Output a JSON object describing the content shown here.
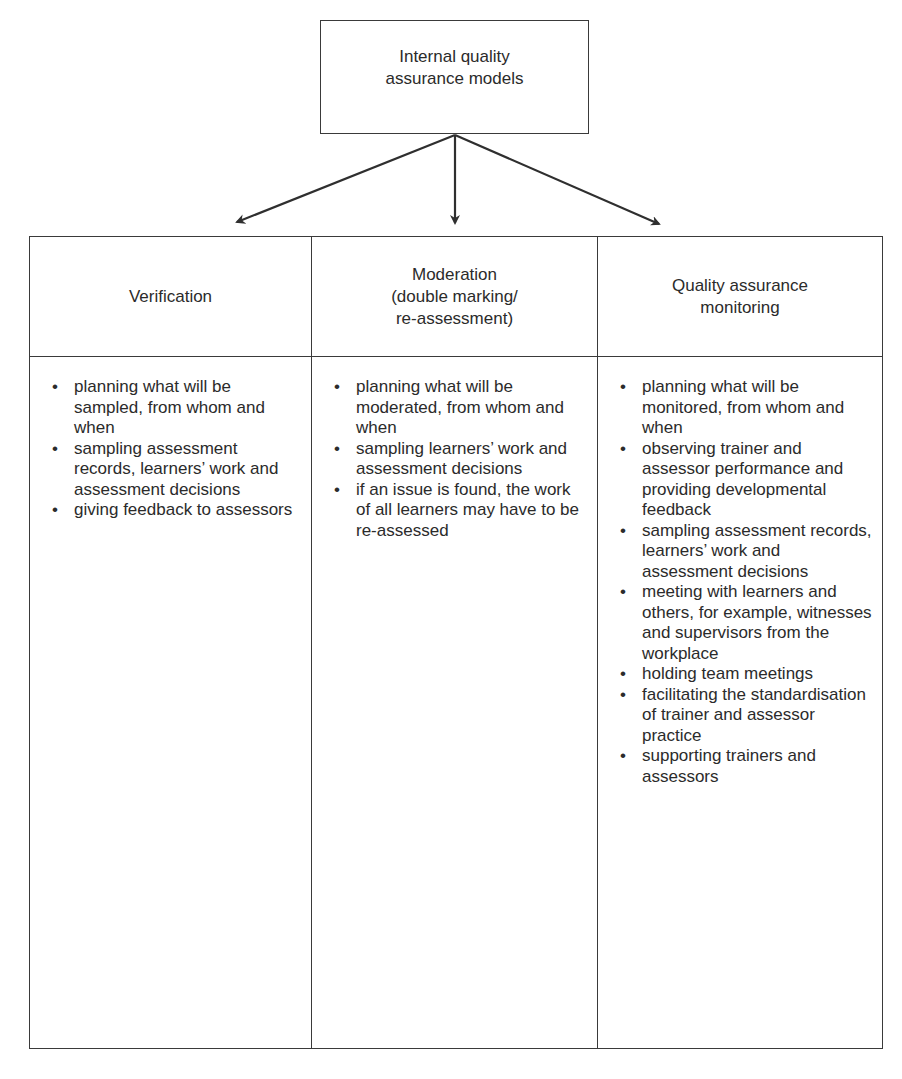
{
  "root": {
    "lines": [
      "Internal quality",
      "assurance models"
    ]
  },
  "columns": [
    {
      "title_lines": [
        "Verification"
      ],
      "items": [
        "planning what will be sampled, from whom and when",
        "sampling assessment records, learners’ work and assessment decisions",
        "giving feedback to assessors"
      ]
    },
    {
      "title_lines": [
        "Moderation",
        "(double marking/",
        "re-assessment)"
      ],
      "items": [
        "planning what will be moderated, from whom and when",
        "sampling learners’ work and assessment decisions",
        "if an issue is found, the work of all learners may have to be re-assessed"
      ]
    },
    {
      "title_lines": [
        "Quality assurance",
        "monitoring"
      ],
      "items": [
        "planning what will be monitored, from whom and when",
        "observing trainer and assessor performance and providing developmental feedback",
        "sampling assessment records, learners’ work and assessment decisions",
        "meeting with learners and others, for example, witnesses and supervisors from the workplace",
        "holding team meetings",
        "facilitating the standardisation of trainer and assessor practice",
        "supporting trainers and assessors"
      ]
    }
  ],
  "bullet_glyph": "•",
  "colors": {
    "line": "#3a3a3a",
    "text": "#2b2b2b",
    "background": "#ffffff"
  }
}
